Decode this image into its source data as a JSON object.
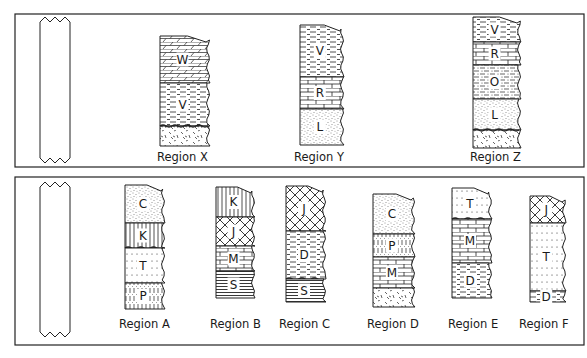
{
  "panels": [
    {
      "id": "top",
      "box": {
        "x": 15,
        "y": 14,
        "w": 569,
        "h": 153
      },
      "blank_column": {
        "x": 40,
        "y": 16,
        "w": 30,
        "h": 148
      },
      "columns": [
        {
          "label": "Region X",
          "x": 160,
          "top": 36,
          "bottom": 146,
          "width": 50,
          "label_x": 157,
          "label_y": 161,
          "layers": [
            {
              "rock": "W",
              "pattern": "slant-brick",
              "h": 47
            },
            {
              "rock": "V",
              "pattern": "dash",
              "h": 43
            },
            {
              "rock": "",
              "pattern": "igneous",
              "h": 20,
              "wavy_top": true
            }
          ]
        },
        {
          "label": "Region Y",
          "x": 300,
          "top": 25,
          "bottom": 145,
          "width": 44,
          "label_x": 294,
          "label_y": 161,
          "layers": [
            {
              "rock": "V",
              "pattern": "dash",
              "h": 52
            },
            {
              "rock": "R",
              "pattern": "brick",
              "h": 32
            },
            {
              "rock": "L",
              "pattern": "sand",
              "h": 36
            }
          ]
        },
        {
          "label": "Region Z",
          "x": 473,
          "top": 17,
          "bottom": 148,
          "width": 48,
          "label_x": 470,
          "label_y": 161,
          "layers": [
            {
              "rock": "V",
              "pattern": "dash",
              "h": 25
            },
            {
              "rock": "R",
              "pattern": "brick",
              "h": 23
            },
            {
              "rock": "O",
              "pattern": "dash-dot",
              "h": 34
            },
            {
              "rock": "L",
              "pattern": "sand",
              "h": 31
            },
            {
              "rock": "",
              "pattern": "igneous",
              "h": 18,
              "wavy_top": true
            }
          ]
        }
      ]
    },
    {
      "id": "bottom",
      "box": {
        "x": 15,
        "y": 177,
        "w": 569,
        "h": 168
      },
      "blank_column": {
        "x": 40,
        "y": 181,
        "w": 30,
        "h": 157
      },
      "columns": [
        {
          "label": "Region A",
          "x": 125,
          "top": 185,
          "bottom": 309,
          "width": 40,
          "label_x": 119,
          "label_y": 328,
          "layers": [
            {
              "rock": "C",
              "pattern": "sand",
              "h": 38
            },
            {
              "rock": "K",
              "pattern": "vertical",
              "h": 25,
              "wavy_bottom": true
            },
            {
              "rock": "T",
              "pattern": "dotted-lines",
              "h": 35
            },
            {
              "rock": "P",
              "pattern": "vertical-dash",
              "h": 26
            }
          ]
        },
        {
          "label": "Region B",
          "x": 216,
          "top": 187,
          "bottom": 298,
          "width": 39,
          "label_x": 210,
          "label_y": 328,
          "layers": [
            {
              "rock": "K",
              "pattern": "vertical",
              "h": 30
            },
            {
              "rock": "J",
              "pattern": "crosshatch",
              "h": 29
            },
            {
              "rock": "M",
              "pattern": "brick",
              "h": 25
            },
            {
              "rock": "S",
              "pattern": "horizontal",
              "h": 27
            }
          ]
        },
        {
          "label": "Region C",
          "x": 286,
          "top": 186,
          "bottom": 302,
          "width": 40,
          "label_x": 279,
          "label_y": 328,
          "layers": [
            {
              "rock": "J",
              "pattern": "crosshatch",
              "h": 45
            },
            {
              "rock": "D",
              "pattern": "dash",
              "h": 48,
              "wavy_bottom": true
            },
            {
              "rock": "S",
              "pattern": "horizontal",
              "h": 23
            }
          ]
        },
        {
          "label": "Region D",
          "x": 373,
          "top": 194,
          "bottom": 307,
          "width": 42,
          "label_x": 367,
          "label_y": 328,
          "layers": [
            {
              "rock": "C",
              "pattern": "sand",
              "h": 40
            },
            {
              "rock": "P",
              "pattern": "vertical-dash",
              "h": 23
            },
            {
              "rock": "M",
              "pattern": "brick",
              "h": 31
            },
            {
              "rock": "",
              "pattern": "igneous",
              "h": 19
            }
          ]
        },
        {
          "label": "Region E",
          "x": 452,
          "top": 188,
          "bottom": 298,
          "width": 40,
          "label_x": 448,
          "label_y": 328,
          "layers": [
            {
              "rock": "T",
              "pattern": "dotted-lines",
              "h": 31,
              "wavy_bottom": true
            },
            {
              "rock": "M",
              "pattern": "brick",
              "h": 44
            },
            {
              "rock": "D",
              "pattern": "dash",
              "h": 35
            }
          ]
        },
        {
          "label": "Region F",
          "x": 530,
          "top": 196,
          "bottom": 302,
          "width": 36,
          "label_x": 519,
          "label_y": 328,
          "layers": [
            {
              "rock": "J",
              "pattern": "crosshatch",
              "h": 27
            },
            {
              "rock": "T",
              "pattern": "dotted-lines",
              "h": 68
            },
            {
              "rock": "D",
              "pattern": "dash",
              "h": 11
            }
          ]
        }
      ]
    }
  ]
}
